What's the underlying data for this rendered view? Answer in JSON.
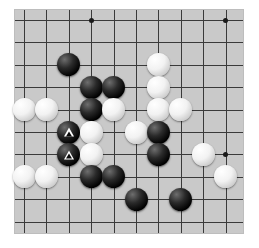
{
  "board": {
    "name": "go-board",
    "background_color": "#c9c9c9",
    "line_color": "#3a3a3a",
    "visible_cols": 10,
    "visible_rows": 10,
    "cell_px": 22.4,
    "origin": {
      "x": 9,
      "y": 10
    },
    "star_points": [
      {
        "col": 3,
        "row": 0
      },
      {
        "col": 9,
        "row": 0
      },
      {
        "col": 9,
        "row": 6
      }
    ],
    "stones": [
      {
        "col": 2,
        "row": 2,
        "color": "black",
        "mark": ""
      },
      {
        "col": 3,
        "row": 3,
        "color": "black",
        "mark": ""
      },
      {
        "col": 4,
        "row": 3,
        "color": "black",
        "mark": ""
      },
      {
        "col": 6,
        "row": 2,
        "color": "white",
        "mark": ""
      },
      {
        "col": 6,
        "row": 3,
        "color": "white",
        "mark": ""
      },
      {
        "col": 0,
        "row": 4,
        "color": "white",
        "mark": ""
      },
      {
        "col": 1,
        "row": 4,
        "color": "white",
        "mark": ""
      },
      {
        "col": 3,
        "row": 4,
        "color": "black",
        "mark": ""
      },
      {
        "col": 4,
        "row": 4,
        "color": "white",
        "mark": ""
      },
      {
        "col": 6,
        "row": 4,
        "color": "white",
        "mark": ""
      },
      {
        "col": 7,
        "row": 4,
        "color": "white",
        "mark": ""
      },
      {
        "col": 2,
        "row": 5,
        "color": "black",
        "mark": "triangle"
      },
      {
        "col": 3,
        "row": 5,
        "color": "white",
        "mark": ""
      },
      {
        "col": 5,
        "row": 5,
        "color": "white",
        "mark": ""
      },
      {
        "col": 6,
        "row": 5,
        "color": "black",
        "mark": ""
      },
      {
        "col": 2,
        "row": 6,
        "color": "black",
        "mark": "triangle"
      },
      {
        "col": 3,
        "row": 6,
        "color": "white",
        "mark": ""
      },
      {
        "col": 6,
        "row": 6,
        "color": "black",
        "mark": ""
      },
      {
        "col": 8,
        "row": 6,
        "color": "white",
        "mark": ""
      },
      {
        "col": 0,
        "row": 7,
        "color": "white",
        "mark": ""
      },
      {
        "col": 1,
        "row": 7,
        "color": "white",
        "mark": ""
      },
      {
        "col": 3,
        "row": 7,
        "color": "black",
        "mark": ""
      },
      {
        "col": 4,
        "row": 7,
        "color": "black",
        "mark": ""
      },
      {
        "col": 9,
        "row": 7,
        "color": "white",
        "mark": ""
      },
      {
        "col": 5,
        "row": 8,
        "color": "black",
        "mark": ""
      },
      {
        "col": 7,
        "row": 8,
        "color": "black",
        "mark": ""
      }
    ],
    "marks": {
      "triangle_glyph": "triangle-marker",
      "triangle_color": "#ffffff"
    }
  }
}
